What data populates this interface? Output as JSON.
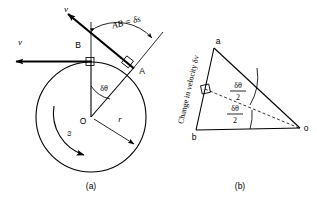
{
  "figure": {
    "title_a": "(a)",
    "title_b": "(b)",
    "panel_a": {
      "name": "circular-motion-diagram",
      "labels": {
        "v_prime": "v",
        "v": "v",
        "point_a": "A",
        "point_b": "B",
        "center": "O",
        "radius": "r",
        "arc_length": "AB = δs",
        "delta_theta": "δθ",
        "omega": "ω"
      },
      "geometry": {
        "center_x": 91,
        "center_y": 117,
        "radius": 55,
        "point_b_x": 91,
        "point_b_y": 62,
        "point_a_x": 133,
        "point_a_y": 68,
        "delta_theta_deg": 40
      }
    },
    "panel_b": {
      "name": "velocity-vector-triangle",
      "labels": {
        "vertex_a": "a",
        "vertex_b": "b",
        "vertex_o": "o",
        "side_label": "Change in velocity δv",
        "angle_upper_num": "δθ",
        "angle_upper_den": "2",
        "angle_lower_num": "δθ",
        "angle_lower_den": "2"
      },
      "geometry": {
        "a_x": 214,
        "a_y": 48,
        "b_x": 196,
        "b_y": 130,
        "o_x": 300,
        "o_y": 128
      }
    },
    "colors": {
      "ink": "#000000",
      "background": "#ffffff"
    }
  }
}
